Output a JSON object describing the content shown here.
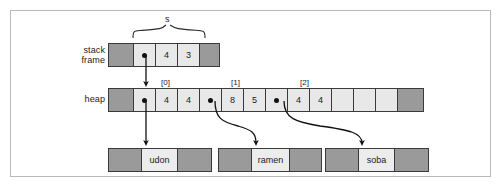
{
  "figure": {
    "colors": {
      "dark_cell": "#9a9a9a",
      "light_cell": "#e8e8e8",
      "border": "#3a3a3a",
      "frame_border": "#b9b9b9",
      "arrow": "#111111",
      "background": "#ffffff"
    }
  },
  "brace": {
    "label": "s"
  },
  "stack": {
    "label_line1": "stack",
    "label_line2": "frame",
    "cells": [
      {
        "kind": "dark",
        "text": ""
      },
      {
        "kind": "pointer",
        "text": ""
      },
      {
        "kind": "light",
        "text": "4"
      },
      {
        "kind": "light",
        "text": "3"
      },
      {
        "kind": "dark",
        "text": ""
      }
    ]
  },
  "heap": {
    "label": "heap",
    "index_labels": [
      "[0]",
      "[1]",
      "[2]"
    ],
    "cells": [
      {
        "kind": "dark",
        "text": ""
      },
      {
        "kind": "pointer",
        "text": ""
      },
      {
        "kind": "light",
        "text": "4"
      },
      {
        "kind": "light",
        "text": "4"
      },
      {
        "kind": "pointer",
        "text": ""
      },
      {
        "kind": "light",
        "text": "8"
      },
      {
        "kind": "light",
        "text": "5"
      },
      {
        "kind": "pointer",
        "text": ""
      },
      {
        "kind": "light",
        "text": "4"
      },
      {
        "kind": "light",
        "text": "4"
      },
      {
        "kind": "empty",
        "text": ""
      },
      {
        "kind": "empty",
        "text": ""
      },
      {
        "kind": "empty",
        "text": ""
      },
      {
        "kind": "dark",
        "text": ""
      }
    ]
  },
  "strings": [
    {
      "name": "udon",
      "cells": [
        {
          "kind": "dark",
          "text": ""
        },
        {
          "kind": "strbox",
          "text": "udon"
        },
        {
          "kind": "dark",
          "text": ""
        }
      ]
    },
    {
      "name": "ramen",
      "cells": [
        {
          "kind": "dark",
          "text": ""
        },
        {
          "kind": "strbox",
          "text": "ramen"
        },
        {
          "kind": "dark",
          "text": ""
        }
      ]
    },
    {
      "name": "soba",
      "cells": [
        {
          "kind": "dark",
          "text": ""
        },
        {
          "kind": "strbox",
          "text": "soba"
        },
        {
          "kind": "dark",
          "text": ""
        }
      ]
    }
  ],
  "arrows": [
    {
      "name": "stack-to-heap",
      "kind": "straight"
    },
    {
      "name": "heap0-to-udon",
      "kind": "straight"
    },
    {
      "name": "heap1-to-ramen",
      "kind": "curved"
    },
    {
      "name": "heap2-to-soba",
      "kind": "curved"
    }
  ]
}
